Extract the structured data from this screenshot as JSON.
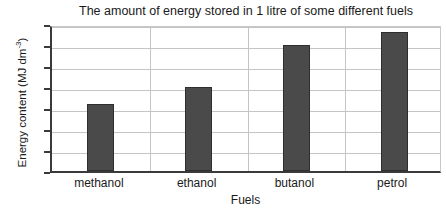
{
  "chart_data": {
    "type": "bar",
    "title": "The amount of energy stored in 1 litre of some different fuels",
    "xlabel": "Fuels",
    "ylabel": "Energy content (MJ dm",
    "ylabel_sup": "-3",
    "ylabel_tail": ")",
    "categories": [
      "methanol",
      "ethanol",
      "butanol",
      "petrol"
    ],
    "values": [
      16,
      20,
      30,
      33
    ],
    "ylim": [
      0,
      35
    ],
    "yticks": [
      0,
      5,
      10,
      15,
      20,
      25,
      30,
      35
    ],
    "ytick_labels": [
      "0",
      "5",
      "10",
      "15",
      "20",
      "25",
      "30",
      "35"
    ],
    "grid": true,
    "legend": false,
    "bar_color": "#4a4a4a",
    "bar_edge_color": "#2e2e2e",
    "gridline_color": "#c4c4c4",
    "axis_color": "#3a3a3a",
    "background_color": "#ffffff"
  }
}
